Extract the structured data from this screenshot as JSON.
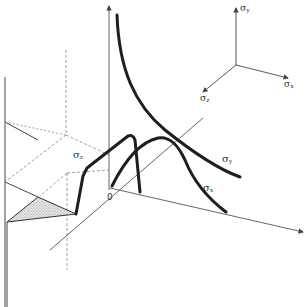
{
  "diagram": {
    "type": "3d-stress-distribution",
    "colors": {
      "curve": "#1e1e1e",
      "axis": "#555555",
      "dashed": "#888888",
      "shade": "#bdbdbd"
    },
    "axes_legend": {
      "y": {
        "symbol": "σ",
        "sub": "y"
      },
      "x": {
        "symbol": "σ",
        "sub": "x"
      },
      "z": {
        "symbol": "σ",
        "sub": "z"
      }
    },
    "curve_labels": {
      "sigma_y": {
        "symbol": "σ",
        "sub": "y"
      },
      "sigma_x": {
        "symbol": "σ",
        "sub": "x"
      },
      "sigma_z": {
        "symbol": "σ",
        "sub": "z"
      }
    },
    "origin_label": "0"
  }
}
